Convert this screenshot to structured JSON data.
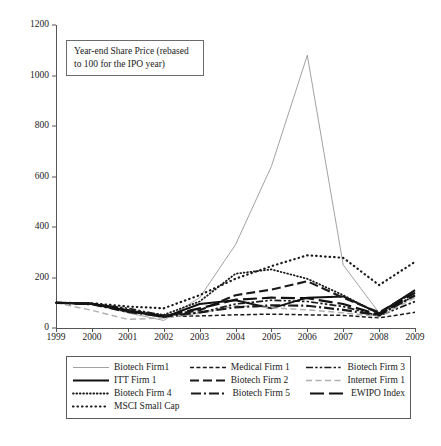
{
  "title_box": {
    "line1": "Year-end Share Price (rebased",
    "line2": "to 100 for the IPO year)",
    "text": "Year-end Share Price (rebased to 100 for the IPO year)"
  },
  "legend": {
    "entries": [
      {
        "label": "Biotech Firm1",
        "style": "thin-solid"
      },
      {
        "label": "Medical Firm 1",
        "style": "fine-dash"
      },
      {
        "label": "Biotech Firm 3",
        "style": "dash-dot-dot"
      },
      {
        "label": "ITT Firm 1",
        "style": "thick-solid"
      },
      {
        "label": "Biotech Firm 2",
        "style": "long-dash"
      },
      {
        "label": "Internet Firm 1",
        "style": "light-dash"
      },
      {
        "label": "Biotech Firm 4",
        "style": "fine-dot"
      },
      {
        "label": "Biotech Firm 5",
        "style": "dash-dot"
      },
      {
        "label": "EWIPO Index",
        "style": "thick-long-dash"
      },
      {
        "label": "MSCI Small Cap",
        "style": "round-dot"
      }
    ]
  },
  "chart_data": {
    "type": "line",
    "title": "Year-end Share Price (rebased to 100 for the IPO year)",
    "xlabel": "",
    "ylabel": "",
    "x": [
      1999,
      2000,
      2001,
      2002,
      2003,
      2004,
      2005,
      2006,
      2007,
      2008,
      2009
    ],
    "categories": [
      "1999",
      "2000",
      "2001",
      "2002",
      "2003",
      "2004",
      "2005",
      "2006",
      "2007",
      "2008",
      "2009"
    ],
    "xlim": [
      1999,
      2009
    ],
    "ylim": [
      0,
      1200
    ],
    "yticks": [
      0,
      200,
      400,
      600,
      800,
      1000,
      1200
    ],
    "xticks": [
      "1999",
      "2000",
      "2001",
      "2002",
      "2003",
      "2004",
      "2005",
      "2006",
      "2007",
      "2008",
      "2009"
    ],
    "grid": false,
    "legend_position": "below-plot",
    "series": [
      {
        "name": "Biotech Firm1",
        "style": "thin-solid",
        "values": [
          100,
          96,
          60,
          30,
          120,
          330,
          640,
          1080,
          250,
          60,
          150
        ]
      },
      {
        "name": "Medical Firm 1",
        "style": "fine-dash",
        "values": [
          100,
          98,
          72,
          45,
          48,
          52,
          55,
          52,
          50,
          40,
          62
        ]
      },
      {
        "name": "Biotech Firm 3",
        "style": "dash-dot-dot",
        "values": [
          100,
          96,
          78,
          50,
          60,
          95,
          110,
          105,
          85,
          48,
          105
        ]
      },
      {
        "name": "ITT Firm 1",
        "style": "thick-solid",
        "values": [
          100,
          95,
          70,
          42,
          95,
          110,
          78,
          120,
          125,
          58,
          150
        ]
      },
      {
        "name": "Biotech Firm 2",
        "style": "long-dash",
        "values": [
          100,
          97,
          66,
          48,
          70,
          130,
          152,
          185,
          120,
          62,
          145
        ]
      },
      {
        "name": "Internet Firm 1",
        "style": "light-dash",
        "values": [
          100,
          70,
          34,
          40,
          58,
          88,
          80,
          72,
          60,
          45,
          120
        ]
      },
      {
        "name": "Biotech Firm 4",
        "style": "fine-dot",
        "values": [
          100,
          96,
          70,
          52,
          105,
          215,
          232,
          195,
          130,
          55,
          128
        ]
      },
      {
        "name": "Biotech Firm 5",
        "style": "dash-dot",
        "values": [
          100,
          94,
          64,
          45,
          62,
          82,
          90,
          88,
          72,
          50,
          130
        ]
      },
      {
        "name": "EWIPO Index",
        "style": "thick-long-dash",
        "values": [
          100,
          96,
          68,
          46,
          78,
          112,
          120,
          118,
          95,
          52,
          140
        ]
      },
      {
        "name": "MSCI Small Cap",
        "style": "round-dot",
        "values": [
          100,
          98,
          85,
          78,
          130,
          195,
          245,
          288,
          278,
          170,
          262
        ]
      }
    ]
  }
}
